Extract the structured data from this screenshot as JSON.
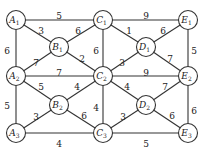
{
  "nodes": [
    {
      "id": "A1",
      "letter": "A",
      "sub": "1",
      "x": 16,
      "y": 20
    },
    {
      "id": "B1",
      "letter": "B",
      "sub": "1",
      "x": 59,
      "y": 47
    },
    {
      "id": "C1",
      "letter": "C",
      "sub": "1",
      "x": 103,
      "y": 20
    },
    {
      "id": "D1",
      "letter": "D",
      "sub": "1",
      "x": 146,
      "y": 47
    },
    {
      "id": "E1",
      "letter": "E",
      "sub": "1",
      "x": 188,
      "y": 20
    },
    {
      "id": "A2",
      "letter": "A",
      "sub": "2",
      "x": 16,
      "y": 76
    },
    {
      "id": "C2",
      "letter": "C",
      "sub": "2",
      "x": 103,
      "y": 76
    },
    {
      "id": "E2",
      "letter": "E",
      "sub": "2",
      "x": 188,
      "y": 76
    },
    {
      "id": "B2",
      "letter": "B",
      "sub": "2",
      "x": 59,
      "y": 105
    },
    {
      "id": "D2",
      "letter": "D",
      "sub": "2",
      "x": 146,
      "y": 105
    },
    {
      "id": "A3",
      "letter": "A",
      "sub": "3",
      "x": 16,
      "y": 133
    },
    {
      "id": "C3",
      "letter": "C",
      "sub": "3",
      "x": 103,
      "y": 133
    },
    {
      "id": "E3",
      "letter": "E",
      "sub": "3",
      "x": 188,
      "y": 133
    }
  ],
  "edges": [
    {
      "from": "A1",
      "to": "C1",
      "weight": "5",
      "lx": 59,
      "ly": 16
    },
    {
      "from": "C1",
      "to": "E1",
      "weight": "9",
      "lx": 146,
      "ly": 16
    },
    {
      "from": "A1",
      "to": "B1",
      "weight": "3",
      "lx": 41,
      "ly": 31
    },
    {
      "from": "B1",
      "to": "C1",
      "weight": "6",
      "lx": 78,
      "ly": 31
    },
    {
      "from": "C1",
      "to": "D1",
      "weight": "1",
      "lx": 129,
      "ly": 31
    },
    {
      "from": "D1",
      "to": "E1",
      "weight": "6",
      "lx": 163,
      "ly": 31
    },
    {
      "from": "A1",
      "to": "A2",
      "weight": "6",
      "lx": 7,
      "ly": 51
    },
    {
      "from": "C1",
      "to": "C2",
      "weight": "6",
      "lx": 96,
      "ly": 51
    },
    {
      "from": "E1",
      "to": "E2",
      "weight": "5",
      "lx": 194,
      "ly": 51
    },
    {
      "from": "A2",
      "to": "B1",
      "weight": "7",
      "lx": 36,
      "ly": 63
    },
    {
      "from": "B1",
      "to": "C2",
      "weight": "2",
      "lx": 82,
      "ly": 59
    },
    {
      "from": "C2",
      "to": "D1",
      "weight": "3",
      "lx": 122,
      "ly": 63
    },
    {
      "from": "D1",
      "to": "E2",
      "weight": "7",
      "lx": 170,
      "ly": 59
    },
    {
      "from": "A2",
      "to": "C2",
      "weight": "7",
      "lx": 59,
      "ly": 73
    },
    {
      "from": "C2",
      "to": "E2",
      "weight": "9",
      "lx": 146,
      "ly": 73
    },
    {
      "from": "A2",
      "to": "B2",
      "weight": "5",
      "lx": 41,
      "ly": 87
    },
    {
      "from": "B2",
      "to": "C2",
      "weight": "4",
      "lx": 77,
      "ly": 87
    },
    {
      "from": "C2",
      "to": "D2",
      "weight": "4",
      "lx": 127,
      "ly": 87
    },
    {
      "from": "D2",
      "to": "E2",
      "weight": "7",
      "lx": 165,
      "ly": 87
    },
    {
      "from": "A2",
      "to": "A3",
      "weight": "5",
      "lx": 7,
      "ly": 106
    },
    {
      "from": "C2",
      "to": "C3",
      "weight": "4",
      "lx": 96,
      "ly": 108
    },
    {
      "from": "E2",
      "to": "E3",
      "weight": "6",
      "lx": 194,
      "ly": 111
    },
    {
      "from": "A3",
      "to": "B2",
      "weight": "3",
      "lx": 36,
      "ly": 117
    },
    {
      "from": "B2",
      "to": "C3",
      "weight": "6",
      "lx": 84,
      "ly": 116
    },
    {
      "from": "C3",
      "to": "D2",
      "weight": "3",
      "lx": 123,
      "ly": 117
    },
    {
      "from": "D2",
      "to": "E3",
      "weight": "6",
      "lx": 172,
      "ly": 116
    },
    {
      "from": "A3",
      "to": "C3",
      "weight": "4",
      "lx": 59,
      "ly": 144
    },
    {
      "from": "C3",
      "to": "E3",
      "weight": "5",
      "lx": 146,
      "ly": 144
    }
  ]
}
